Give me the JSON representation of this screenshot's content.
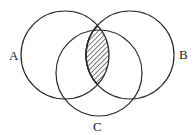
{
  "diagram": {
    "type": "venn",
    "sets": [
      {
        "id": "A",
        "label": "A",
        "cx": 65,
        "cy": 55,
        "r": 44,
        "label_x": 9,
        "label_y": 60
      },
      {
        "id": "B",
        "label": "B",
        "cx": 130,
        "cy": 55,
        "r": 44,
        "label_x": 179,
        "label_y": 59
      },
      {
        "id": "C",
        "label": "C",
        "cx": 99,
        "cy": 73,
        "r": 43,
        "label_x": 93,
        "label_y": 131
      }
    ],
    "shaded_region": "A ∩ B",
    "shading_pattern": "diagonal-hatch",
    "colors": {
      "stroke": "#2a2a2a",
      "background": "#ffffff",
      "hatch": "#2a2a2a"
    }
  }
}
